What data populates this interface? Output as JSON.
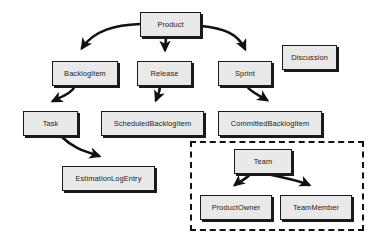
{
  "diagram": {
    "background_color": "#ffffff",
    "node_fill_color": "#e9e9e9",
    "node_border_color": "#1a1a1a",
    "arrow_color": "#111111",
    "group_border_style": "dashed",
    "nodes": [
      {
        "id": "product",
        "label": "Product",
        "x": 140,
        "y": 12,
        "w": 61,
        "h": 25
      },
      {
        "id": "backlogitem",
        "label": "BacklogItem",
        "x": 52,
        "y": 61,
        "w": 66,
        "h": 25
      },
      {
        "id": "release",
        "label": "Release",
        "x": 137,
        "y": 61,
        "w": 55,
        "h": 25
      },
      {
        "id": "sprint",
        "label": "Sprint",
        "x": 218,
        "y": 61,
        "w": 54,
        "h": 25
      },
      {
        "id": "discussion",
        "label": "Discussion",
        "x": 282,
        "y": 45,
        "w": 55,
        "h": 25
      },
      {
        "id": "task",
        "label": "Task",
        "x": 23,
        "y": 111,
        "w": 55,
        "h": 25
      },
      {
        "id": "scheduledbacklogitem",
        "label": "ScheduledBacklogItem",
        "x": 101,
        "y": 111,
        "w": 103,
        "h": 25
      },
      {
        "id": "committedbacklogitem",
        "label": "CommittedBacklogItem",
        "x": 218,
        "y": 111,
        "w": 104,
        "h": 25
      },
      {
        "id": "estimationlogentry",
        "label": "EstimationLogEntry",
        "x": 62,
        "y": 166,
        "w": 93,
        "h": 25
      },
      {
        "id": "team",
        "label": "Team",
        "x": 234,
        "y": 149,
        "w": 58,
        "h": 25
      },
      {
        "id": "productowner",
        "label": "ProductOwner",
        "x": 200,
        "y": 195,
        "w": 72,
        "h": 25
      },
      {
        "id": "teammember",
        "label": "TeamMember",
        "x": 280,
        "y": 195,
        "w": 72,
        "h": 25
      }
    ],
    "groups": [
      {
        "id": "team-group",
        "label": "",
        "x": 190,
        "y": 141,
        "w": 174,
        "h": 90
      }
    ],
    "edges": [
      {
        "id": "product-to-backlogitem",
        "from": "product",
        "to": "backlogitem"
      },
      {
        "id": "product-to-release",
        "from": "product",
        "to": "release"
      },
      {
        "id": "product-to-sprint",
        "from": "product",
        "to": "sprint"
      },
      {
        "id": "backlogitem-to-task",
        "from": "backlogitem",
        "to": "task"
      },
      {
        "id": "release-to-scheduledbacklogitem",
        "from": "release",
        "to": "scheduledbacklogitem"
      },
      {
        "id": "sprint-to-committedbacklogitem",
        "from": "sprint",
        "to": "committedbacklogitem"
      },
      {
        "id": "task-to-estimationlogentry",
        "from": "task",
        "to": "estimationlogentry"
      },
      {
        "id": "team-to-productowner",
        "from": "team",
        "to": "productowner"
      },
      {
        "id": "team-to-teammember",
        "from": "team",
        "to": "teammember"
      }
    ]
  }
}
